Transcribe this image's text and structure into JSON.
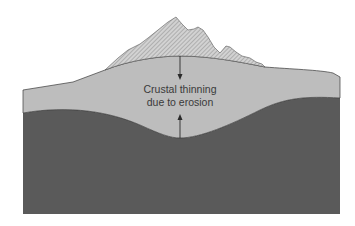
{
  "diagram": {
    "label_line1": "Crustal thinning",
    "label_line2": "due to erosion",
    "colors": {
      "background": "#ffffff",
      "mountain_fill": "#c8c8c8",
      "mountain_hatch": "#8a8a8a",
      "crust": "#bdbdbd",
      "mantle": "#5a5a5a",
      "outline": "#3a3a3a",
      "arrow": "#2a2a2a"
    },
    "layers": [
      "eroded-mountain",
      "crust",
      "mantle"
    ]
  }
}
